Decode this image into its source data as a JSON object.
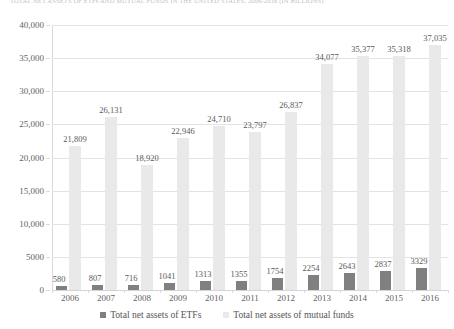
{
  "figure": {
    "title_cut_off": "TOTAL NET ASSETS OF ETFs AND MUTUAL FUNDS IN THE UNITED STATES, 2006-2016 (IN BILLIONS)"
  },
  "chart_data": {
    "type": "bar",
    "title": "",
    "xlabel": "",
    "ylabel": "",
    "ylim": [
      0,
      40000
    ],
    "grid": true,
    "legend_position": "bottom",
    "categories": [
      "2006",
      "2007",
      "2008",
      "2009",
      "2010",
      "2011",
      "2012",
      "2013",
      "2014",
      "2015",
      "2016"
    ],
    "ytick_labels": [
      "0",
      "5000",
      "10,000",
      "15,000",
      "20,000",
      "25,000",
      "30,000",
      "35,000",
      "40,000"
    ],
    "ytick_values": [
      0,
      5000,
      10000,
      15000,
      20000,
      25000,
      30000,
      35000,
      40000
    ],
    "series": [
      {
        "name": "Total net assets of ETFs",
        "color": "#808080",
        "values": [
          580,
          807,
          716,
          1041,
          1313,
          1355,
          1754,
          2254,
          2643,
          2837,
          3329
        ],
        "labels": [
          "580",
          "807",
          "716",
          "1041",
          "1313",
          "1355",
          "1754",
          "2254",
          "2643",
          "2837",
          "3329"
        ]
      },
      {
        "name": "Total net assets of mutual funds",
        "color": "#e9e9e9",
        "values": [
          21809,
          26131,
          18920,
          22946,
          24710,
          23797,
          26837,
          34077,
          35377,
          35318,
          37035
        ],
        "labels": [
          "21,809",
          "26,131",
          "18,920",
          "22,946",
          "24,710",
          "23,797",
          "26,837",
          "34,077",
          "35,377",
          "35,318",
          "37,035"
        ]
      }
    ]
  }
}
